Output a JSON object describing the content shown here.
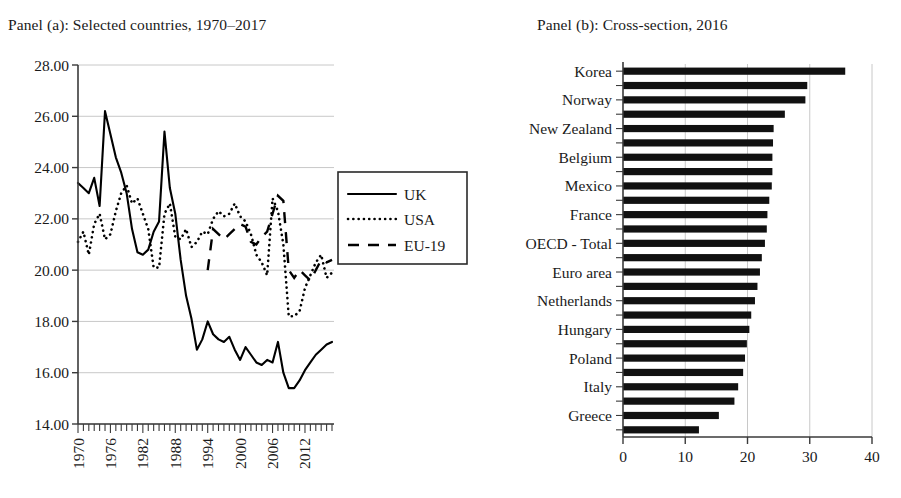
{
  "figure": {
    "panel_a_title": "Panel (a): Selected countries, 1970–2017",
    "panel_b_title": "Panel (b): Cross-section, 2016"
  },
  "chart_data": [
    {
      "type": "line",
      "title": "Panel (a): Selected countries, 1970–2017",
      "xlabel": "",
      "ylabel": "",
      "xlim": [
        1970,
        2017
      ],
      "ylim": [
        14.0,
        28.0
      ],
      "grid": true,
      "legend_position": "right",
      "ytick_labels": [
        "28.00",
        "26.00",
        "24.00",
        "22.00",
        "20.00",
        "18.00",
        "16.00",
        "14.00"
      ],
      "ytick_values": [
        28,
        26,
        24,
        22,
        20,
        18,
        16,
        14
      ],
      "xtick_labels": [
        "1970",
        "1976",
        "1982",
        "1988",
        "1994",
        "2000",
        "2006",
        "2012"
      ],
      "xtick_values": [
        1970,
        1976,
        1982,
        1988,
        1994,
        2000,
        2006,
        2012
      ],
      "series": [
        {
          "name": "UK",
          "style": "solid",
          "x": [
            1970,
            1971,
            1972,
            1973,
            1974,
            1975,
            1976,
            1977,
            1978,
            1979,
            1980,
            1981,
            1982,
            1983,
            1984,
            1985,
            1986,
            1987,
            1988,
            1989,
            1990,
            1991,
            1992,
            1993,
            1994,
            1995,
            1996,
            1997,
            1998,
            1999,
            2000,
            2001,
            2002,
            2003,
            2004,
            2005,
            2006,
            2007,
            2008,
            2009,
            2010,
            2011,
            2012,
            2013,
            2014,
            2015,
            2016,
            2017
          ],
          "values": [
            23.4,
            23.2,
            23.0,
            23.6,
            22.5,
            26.2,
            25.3,
            24.4,
            23.8,
            23.0,
            21.6,
            20.7,
            20.6,
            20.8,
            21.5,
            21.9,
            25.4,
            23.2,
            22.2,
            20.4,
            19.0,
            18.1,
            16.9,
            17.3,
            18.0,
            17.5,
            17.3,
            17.2,
            17.4,
            16.9,
            16.5,
            17.0,
            16.7,
            16.4,
            16.3,
            16.5,
            16.4,
            17.2,
            16.0,
            15.4,
            15.4,
            15.7,
            16.1,
            16.4,
            16.7,
            16.9,
            17.1,
            17.2
          ]
        },
        {
          "name": "USA",
          "style": "dotted",
          "x": [
            1970,
            1971,
            1972,
            1973,
            1974,
            1975,
            1976,
            1977,
            1978,
            1979,
            1980,
            1981,
            1982,
            1983,
            1984,
            1985,
            1986,
            1987,
            1988,
            1989,
            1990,
            1991,
            1992,
            1993,
            1994,
            1995,
            1996,
            1997,
            1998,
            1999,
            2000,
            2001,
            2002,
            2003,
            2004,
            2005,
            2006,
            2007,
            2008,
            2009,
            2010,
            2011,
            2012,
            2013,
            2014,
            2015,
            2016,
            2017
          ],
          "values": [
            21.1,
            21.5,
            20.6,
            21.8,
            22.2,
            21.2,
            21.4,
            22.3,
            23.0,
            23.3,
            22.6,
            22.8,
            22.2,
            21.6,
            20.1,
            20.1,
            22.2,
            22.6,
            21.3,
            21.2,
            21.6,
            20.9,
            21.1,
            21.5,
            21.4,
            22.0,
            22.3,
            22.1,
            22.2,
            22.6,
            22.1,
            21.9,
            21.4,
            20.6,
            20.3,
            19.8,
            22.8,
            22.3,
            21.0,
            18.2,
            18.2,
            18.4,
            19.3,
            19.8,
            20.3,
            20.6,
            19.7,
            19.9
          ]
        },
        {
          "name": "EU-19",
          "style": "dashed",
          "x": [
            1994,
            1995,
            1996,
            1997,
            1998,
            1999,
            2000,
            2001,
            2002,
            2003,
            2004,
            2005,
            2006,
            2007,
            2008,
            2009,
            2010,
            2011,
            2012,
            2013,
            2014,
            2015,
            2016,
            2017
          ],
          "values": [
            20.0,
            21.6,
            21.4,
            21.2,
            21.4,
            21.6,
            21.8,
            21.7,
            21.1,
            21.0,
            21.3,
            21.5,
            22.2,
            22.9,
            22.7,
            20.0,
            19.7,
            20.0,
            19.8,
            19.6,
            20.0,
            20.4,
            20.3,
            20.4
          ]
        }
      ],
      "legend": [
        {
          "label": "UK",
          "style": "solid"
        },
        {
          "label": "USA",
          "style": "dotted"
        },
        {
          "label": "EU-19",
          "style": "dashed"
        }
      ]
    },
    {
      "type": "bar",
      "orientation": "horizontal",
      "title": "Panel (b): Cross-section, 2016",
      "xlabel": "",
      "ylabel": "",
      "xlim": [
        0,
        40
      ],
      "grid": true,
      "xtick_labels": [
        "0",
        "10",
        "20",
        "30",
        "40"
      ],
      "xtick_values": [
        0,
        10,
        20,
        30,
        40
      ],
      "categories": [
        "Korea",
        "",
        "Norway",
        "",
        "New Zealand",
        "",
        "Belgium",
        "",
        "Mexico",
        "",
        "France",
        "",
        "OECD - Total",
        "",
        "Euro area",
        "",
        "Netherlands",
        "",
        "Hungary",
        "",
        "Poland",
        "",
        "Italy",
        "",
        "Greece",
        ""
      ],
      "visible_labels": [
        "Korea",
        "Norway",
        "New Zealand",
        "Belgium",
        "Mexico",
        "France",
        "OECD - Total",
        "Euro area",
        "Netherlands",
        "Hungary",
        "Poland",
        "Italy",
        "Greece"
      ],
      "values": [
        35.7,
        29.6,
        29.3,
        26.0,
        24.2,
        24.1,
        24.0,
        24.0,
        23.9,
        23.5,
        23.2,
        23.1,
        22.8,
        22.3,
        22.0,
        21.6,
        21.2,
        20.6,
        20.3,
        19.9,
        19.6,
        19.3,
        18.5,
        17.9,
        15.4,
        12.2
      ]
    }
  ]
}
